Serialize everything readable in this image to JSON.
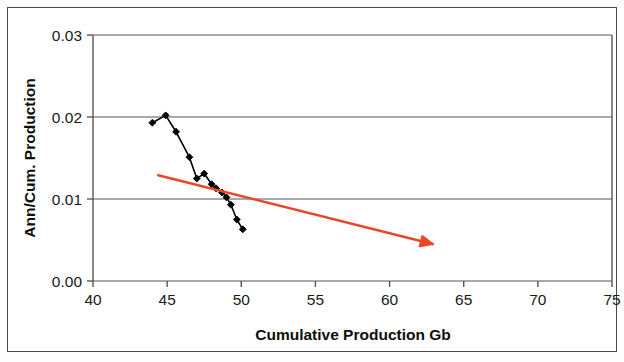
{
  "figure": {
    "background_color": "#ffffff",
    "frame_color": "#4a4a4a"
  },
  "chart_data": {
    "type": "line",
    "title": "",
    "subtitle": "",
    "xlabel": "Cumulative Production Gb",
    "ylabel": "Ann/Cum. Production",
    "xlim": [
      40,
      75
    ],
    "ylim": [
      0.0,
      0.03
    ],
    "xticks": [
      40,
      45,
      50,
      55,
      60,
      65,
      70,
      75
    ],
    "xtick_labels": [
      "40",
      "45",
      "50",
      "55",
      "60",
      "65",
      "70",
      "75"
    ],
    "yticks": [
      0.0,
      0.01,
      0.02,
      0.03
    ],
    "ytick_labels": [
      "0.00",
      "0.01",
      "0.02",
      "0.03"
    ],
    "grid": "horizontal",
    "grid_color": "#555555",
    "legend": null,
    "legend_position": "none",
    "series": [
      {
        "name": "Ann/Cum. Production vs Cumulative Production",
        "type": "line",
        "color": "#000000",
        "marker": "diamond",
        "marker_color": "#000000",
        "x": [
          44.0,
          44.9,
          45.6,
          46.5,
          47.0,
          47.5,
          48.0,
          48.3,
          48.7,
          49.0,
          49.3,
          49.7,
          50.1
        ],
        "y": [
          0.0193,
          0.0202,
          0.0182,
          0.0151,
          0.0125,
          0.0131,
          0.0118,
          0.0113,
          0.0108,
          0.0102,
          0.0093,
          0.0075,
          0.0063
        ]
      }
    ],
    "annotations": [
      {
        "name": "trend-arrow",
        "type": "arrow",
        "color": "#e8482a",
        "x_start": 44.4,
        "y_start": 0.0129,
        "x_end": 62.9,
        "y_end": 0.0045
      }
    ]
  }
}
